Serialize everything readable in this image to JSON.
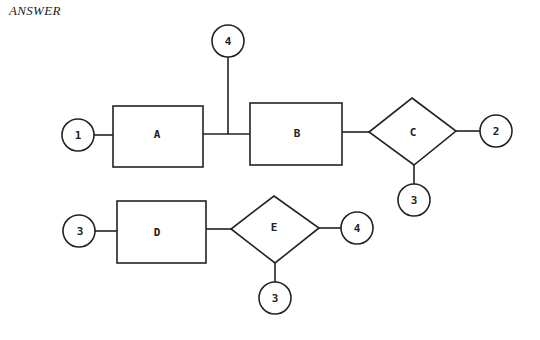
{
  "title": "ANSWER",
  "diagram": {
    "stroke_color": "#222222",
    "row1": {
      "circle_1": "1",
      "box_A": "A",
      "circle_4": "4",
      "box_B": "B",
      "diamond_C": "C",
      "circle_2": "2",
      "circle_3": "3"
    },
    "row2": {
      "circle_3_left": "3",
      "box_D": "D",
      "diamond_E": "E",
      "circle_4": "4",
      "circle_3_bottom": "3"
    }
  }
}
